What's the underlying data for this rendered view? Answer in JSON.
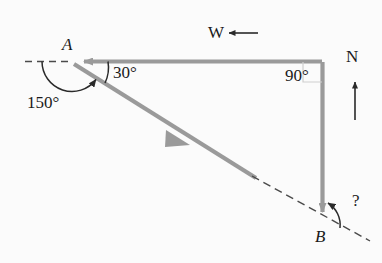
{
  "figure": {
    "background_color": "#fbfbfb",
    "vector_color": "#999999",
    "line_color": "#4a4a4a",
    "text_color": "#1a1a1a"
  },
  "points": {
    "A": {
      "label": "A",
      "x": 72,
      "y": 62
    },
    "B": {
      "label": "B",
      "x": 323,
      "y": 222
    },
    "corner": {
      "x": 323,
      "y": 62
    }
  },
  "angles": {
    "at_A_interior": {
      "label": "30°",
      "value": 30,
      "unit": "degrees"
    },
    "at_A_bearing": {
      "label": "150°",
      "value": 150,
      "unit": "degrees"
    },
    "at_corner": {
      "label": "90°",
      "value": 90,
      "unit": "degrees"
    },
    "at_B_unknown": {
      "label": "?",
      "value": null,
      "unit": "degrees"
    }
  },
  "compass": {
    "west": {
      "label": "W",
      "direction": "left"
    },
    "north": {
      "label": "N",
      "direction": "up"
    }
  },
  "vectors": [
    {
      "name": "corner-to-A",
      "from": "corner",
      "to": "A",
      "style": "solid-arrow",
      "color": "#999999"
    },
    {
      "name": "A-to-B",
      "from": "A",
      "to": "B",
      "style": "solid-arrow-then-dashed",
      "color": "#999999"
    },
    {
      "name": "corner-to-B",
      "from": "corner",
      "to": "B",
      "style": "solid-arrow",
      "color": "#999999"
    }
  ],
  "dashed_lines": [
    {
      "name": "horizontal-reference-at-A",
      "note": "westward dashed reference line through A"
    },
    {
      "name": "AB-extension-past-B",
      "note": "dashed extension of line AB beyond B"
    }
  ]
}
